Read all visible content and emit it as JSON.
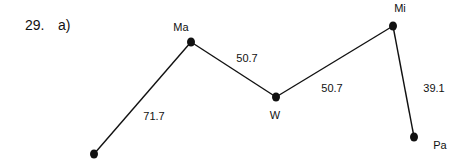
{
  "question": {
    "number": "29.",
    "part": "a)"
  },
  "colors": {
    "ink": "#111111",
    "background": "#ffffff"
  },
  "diagram": {
    "type": "weighted-graph",
    "nodes": [
      {
        "id": "start",
        "label": "",
        "x": 94,
        "y": 154
      },
      {
        "id": "Ma",
        "label": "Ma",
        "x": 191,
        "y": 42
      },
      {
        "id": "W",
        "label": "W",
        "x": 276,
        "y": 97
      },
      {
        "id": "Mi",
        "label": "Mi",
        "x": 393,
        "y": 26
      },
      {
        "id": "Pa",
        "label": "Pa",
        "x": 414,
        "y": 137
      }
    ],
    "edges": [
      {
        "from": "start",
        "to": "Ma",
        "weight": "71.7"
      },
      {
        "from": "Ma",
        "to": "W",
        "weight": "50.7"
      },
      {
        "from": "W",
        "to": "Mi",
        "weight": "50.7"
      },
      {
        "from": "Mi",
        "to": "Pa",
        "weight": "39.1"
      }
    ]
  }
}
